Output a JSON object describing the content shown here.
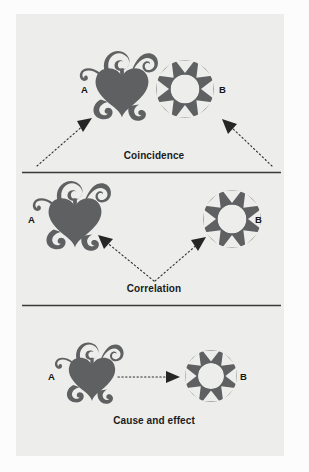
{
  "page": {
    "background_color": "#fcfcfc",
    "panel_color": "#ededeb",
    "ink_color": "#5f6062",
    "line_color": "#333333",
    "text_color": "#1b1b1b"
  },
  "sections": [
    {
      "id": "coincidence",
      "label": "Coincidence",
      "node_a_letter": "A",
      "node_b_letter": "B",
      "node_a_icon": "heart-swirl-icon",
      "node_b_icon": "star-wheel-icon",
      "relation": "two dotted arrows from a shared lower region pointing up-outward to A and to B"
    },
    {
      "id": "correlation",
      "label": "Correlation",
      "node_a_letter": "A",
      "node_b_letter": "B",
      "node_a_icon": "heart-swirl-icon",
      "node_b_icon": "star-wheel-icon",
      "relation": "two dotted arrows diverging from one lower centre point toward A and toward B"
    },
    {
      "id": "cause-and-effect",
      "label": "Cause and effect",
      "node_a_letter": "A",
      "node_b_letter": "B",
      "node_a_icon": "heart-swirl-icon",
      "node_b_icon": "star-wheel-icon",
      "relation": "single horizontal dotted arrow from A to B"
    }
  ],
  "dividers": [
    {
      "id": "divider-1",
      "y": 172
    },
    {
      "id": "divider-2",
      "y": 305
    }
  ]
}
